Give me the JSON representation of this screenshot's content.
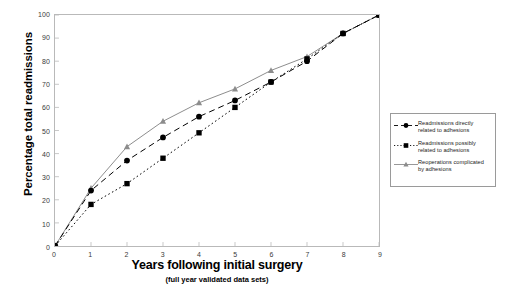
{
  "chart_data": {
    "type": "line",
    "title": "",
    "xlabel": "Years following initial surgery",
    "xsublabel": "(full year validated data sets)",
    "ylabel": "Percentage total readmissions",
    "xlim": [
      0,
      9
    ],
    "ylim": [
      0,
      100
    ],
    "x": [
      0,
      1,
      2,
      3,
      4,
      5,
      6,
      7,
      8,
      9
    ],
    "xticks": [
      "0",
      "1",
      "2",
      "3",
      "4",
      "5",
      "6",
      "7",
      "8",
      "9"
    ],
    "yticks": [
      "0",
      "10",
      "20",
      "30",
      "40",
      "50",
      "60",
      "70",
      "80",
      "90",
      "100"
    ],
    "grid": false,
    "legend_position": "right",
    "series": [
      {
        "name": "Readmissions directly related to adhesions",
        "marker": "circle",
        "linestyle": "dashed",
        "color": "#000000",
        "values": [
          0,
          24,
          37,
          47,
          56,
          63,
          71,
          80,
          92,
          100
        ]
      },
      {
        "name": "Readmissions possibly related to adhesions",
        "marker": "square",
        "linestyle": "dotted",
        "color": "#000000",
        "values": [
          0,
          18,
          27,
          38,
          49,
          60,
          71,
          81,
          92,
          100
        ]
      },
      {
        "name": "Reoperations complicated by adhesions",
        "marker": "triangle",
        "linestyle": "solid",
        "color": "#8c8c8c",
        "values": [
          0,
          25,
          43,
          54,
          62,
          68,
          76,
          82,
          92,
          100
        ]
      }
    ]
  },
  "legend": {
    "items": [
      {
        "line1": "Readmissions directly",
        "line2": "related to adhesions"
      },
      {
        "line1": "Readmissions possibly",
        "line2": "related to adhesions"
      },
      {
        "line1": "Reoperations complicated",
        "line2": "by adhesions"
      }
    ]
  }
}
